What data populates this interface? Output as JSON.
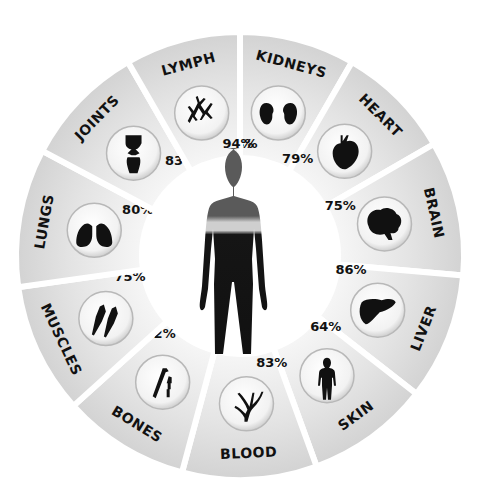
{
  "chart_data": {
    "type": "radial-infographic",
    "title": "",
    "center_image": "human-silhouette",
    "segments": [
      {
        "label": "KIDNEYS",
        "value": 83,
        "display": "83%",
        "icon": "kidneys-icon"
      },
      {
        "label": "HEART",
        "value": 79,
        "display": "79%",
        "icon": "heart-icon"
      },
      {
        "label": "BRAIN",
        "value": 75,
        "display": "75%",
        "icon": "brain-icon"
      },
      {
        "label": "LIVER",
        "value": 86,
        "display": "86%",
        "icon": "liver-icon"
      },
      {
        "label": "SKIN",
        "value": 64,
        "display": "64%",
        "icon": "body-icon"
      },
      {
        "label": "BLOOD",
        "value": 83,
        "display": "83%",
        "icon": "blood-vessels-icon"
      },
      {
        "label": "BONES",
        "value": 22,
        "display": "22%",
        "icon": "bones-icon"
      },
      {
        "label": "MUSCLES",
        "value": 75,
        "display": "75%",
        "icon": "muscles-icon"
      },
      {
        "label": "LUNGS",
        "value": 80,
        "display": "80%",
        "icon": "lungs-icon"
      },
      {
        "label": "JOINTS",
        "value": 83,
        "display": "83%",
        "icon": "joint-icon"
      },
      {
        "label": "LYMPH",
        "value": 94,
        "display": "94%",
        "icon": "lymph-icon"
      }
    ],
    "colors": {
      "segment_fill": "#d9d9d9",
      "segment_fill_light": "#efefef",
      "text": "#111111",
      "silhouette": "#111111",
      "silhouette_upper": "#555555",
      "band": "#cfcfcf"
    }
  }
}
